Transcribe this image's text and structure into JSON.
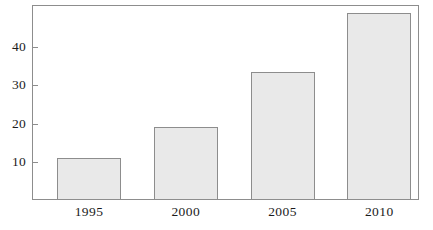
{
  "chart_data": {
    "type": "bar",
    "title": "",
    "subtitle": "",
    "xlabel": "",
    "ylabel": "",
    "categories": [
      "1995",
      "2000",
      "2005",
      "2010"
    ],
    "values": [
      11,
      19,
      33.5,
      49
    ],
    "series": [
      {
        "name": "",
        "values": [
          11,
          19,
          33.5,
          49
        ]
      }
    ],
    "ylim": [
      0,
      51
    ],
    "xlim": [
      0,
      4
    ],
    "y_ticks": [
      10,
      20,
      30,
      40
    ],
    "y_tick_labels": [
      "10",
      "20",
      "30",
      "40"
    ],
    "x_tick_labels": [
      "1995",
      "2000",
      "2005",
      "2010"
    ],
    "grid": false,
    "legend": false,
    "legend_position": "none",
    "annotations": [],
    "colors": {
      "bar_fill": "#e9e9e9",
      "bar_edge": "#8d8d8d",
      "frame": "#8d8d8d",
      "text": "#1b1b1b",
      "background": "#ffffff"
    }
  },
  "axes": {
    "y_ticks": [
      {
        "label": "10",
        "value": 10
      },
      {
        "label": "20",
        "value": 20
      },
      {
        "label": "30",
        "value": 30
      },
      {
        "label": "40",
        "value": 40
      }
    ],
    "x_ticks": [
      {
        "label": "1995"
      },
      {
        "label": "2000"
      },
      {
        "label": "2005"
      },
      {
        "label": "2010"
      }
    ]
  },
  "bars": [
    {
      "category": "1995",
      "value": 11
    },
    {
      "category": "2000",
      "value": 19
    },
    {
      "category": "2005",
      "value": 33.5
    },
    {
      "category": "2010",
      "value": 49
    }
  ]
}
